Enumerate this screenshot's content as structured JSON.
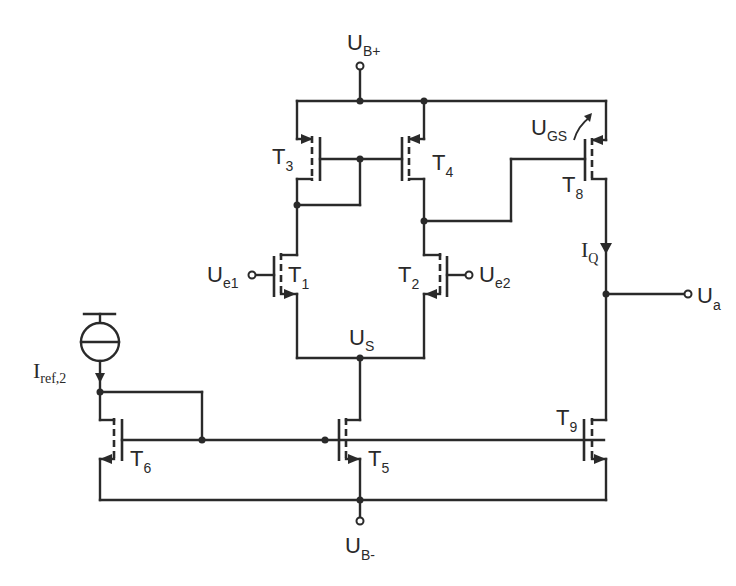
{
  "diagram": {
    "type": "circuit-schematic",
    "colors": {
      "line": "#2a2a2a",
      "background": "#ffffff"
    },
    "supplies": {
      "positive": {
        "main": "U",
        "sub": "B+"
      },
      "negative": {
        "main": "U",
        "sub": "B-"
      }
    },
    "inputs": {
      "e1": {
        "main": "U",
        "sub": "e1"
      },
      "e2": {
        "main": "U",
        "sub": "e2"
      }
    },
    "output": {
      "main": "U",
      "sub": "a"
    },
    "node_us": {
      "main": "U",
      "sub": "S"
    },
    "ugs": {
      "main": "U",
      "sub": "GS"
    },
    "current_q": {
      "main": "I",
      "sub": "Q"
    },
    "current_ref": {
      "main": "I",
      "sub": "ref,2"
    },
    "transistors": {
      "t1": {
        "main": "T",
        "sub": "1"
      },
      "t2": {
        "main": "T",
        "sub": "2"
      },
      "t3": {
        "main": "T",
        "sub": "3"
      },
      "t4": {
        "main": "T",
        "sub": "4"
      },
      "t5": {
        "main": "T",
        "sub": "5"
      },
      "t6": {
        "main": "T",
        "sub": "6"
      },
      "t8": {
        "main": "T",
        "sub": "8"
      },
      "t9": {
        "main": "T",
        "sub": "9"
      }
    }
  }
}
